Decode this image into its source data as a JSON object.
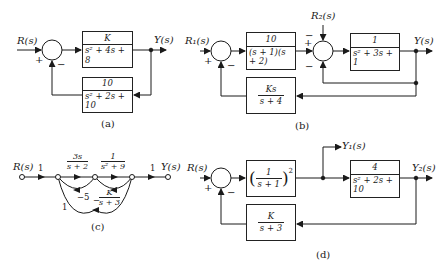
{
  "panels": {
    "a": {
      "caption": "(a)",
      "input": "R(s)",
      "output": "Y(s)",
      "sum_signs": {
        "plus": "+",
        "minus": "−"
      },
      "forward_block": {
        "num": "K",
        "den": "s² + 4s + 8"
      },
      "feedback_block": {
        "num": "10",
        "den": "s² + 2s + 10"
      }
    },
    "b": {
      "caption": "(b)",
      "input1": "R₁(s)",
      "input2": "R₂(s)",
      "output": "Y(s)",
      "sum1_signs": {
        "plus": "+",
        "minus": "−"
      },
      "sum2_signs": {
        "plus": "+",
        "minus_top": "−",
        "minus_bottom": "−"
      },
      "block1": {
        "num": "10",
        "den": "(s + 1)(s + 2)"
      },
      "block2": {
        "num": "1",
        "den": "s² + 3s + 1"
      },
      "feedback_block": {
        "num": "Ks",
        "den": "s + 4"
      }
    },
    "c": {
      "caption": "(c)",
      "input": "R(s)",
      "output": "Y(s)",
      "gains": {
        "in": "1",
        "g1_num": "3s",
        "g1_den": "s + 2",
        "g2_num": "1",
        "g2_den": "s² + 9",
        "out": "1",
        "loop1": "−5",
        "loop2_sign": "−",
        "loop2_num": "K",
        "loop2_den": "s + 3",
        "loop3": "1"
      }
    },
    "d": {
      "caption": "(d)",
      "input": "R(s)",
      "output1": "Y₁(s)",
      "output2": "Y₂(s)",
      "sum_signs": {
        "plus": "+",
        "minus": "−"
      },
      "block1": {
        "num": "1",
        "den": "s + 1",
        "power": "2"
      },
      "block2": {
        "num": "4",
        "den": "s² + 2s + 10"
      },
      "feedback_block": {
        "num": "K",
        "den": "s + 3"
      }
    }
  }
}
